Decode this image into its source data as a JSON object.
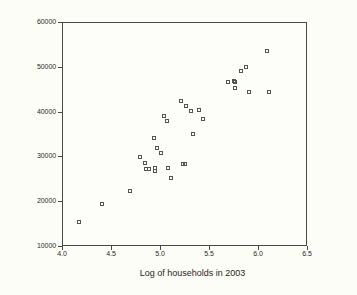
{
  "chart_data": {
    "type": "scatter",
    "title": "",
    "xlabel": "Log of households in 2003",
    "ylabel": "editorial content in sq inches",
    "xlim": [
      4.0,
      6.5
    ],
    "ylim": [
      10000,
      60000
    ],
    "xticks": [
      "4.0",
      "4.5",
      "5.0",
      "5.5",
      "6.0",
      "6.5"
    ],
    "xtick_values": [
      4.0,
      4.5,
      5.0,
      5.5,
      6.0,
      6.5
    ],
    "yticks": [
      "10000",
      "20000",
      "30000",
      "40000",
      "50000",
      "60000"
    ],
    "ytick_values": [
      10000,
      20000,
      30000,
      40000,
      50000,
      60000
    ],
    "grid": false,
    "legend": null,
    "marker": "open-square",
    "marker_color": "#55554e",
    "points": [
      {
        "x": 4.16,
        "y": 15600
      },
      {
        "x": 4.4,
        "y": 19700
      },
      {
        "x": 4.68,
        "y": 22500
      },
      {
        "x": 4.79,
        "y": 30000
      },
      {
        "x": 4.84,
        "y": 28800
      },
      {
        "x": 4.85,
        "y": 27500
      },
      {
        "x": 4.88,
        "y": 27400
      },
      {
        "x": 4.93,
        "y": 34400
      },
      {
        "x": 4.94,
        "y": 27700
      },
      {
        "x": 4.94,
        "y": 26900
      },
      {
        "x": 4.96,
        "y": 32100
      },
      {
        "x": 5.0,
        "y": 30900
      },
      {
        "x": 5.03,
        "y": 39300
      },
      {
        "x": 5.06,
        "y": 38200
      },
      {
        "x": 5.07,
        "y": 27600
      },
      {
        "x": 5.1,
        "y": 25500
      },
      {
        "x": 5.2,
        "y": 42500
      },
      {
        "x": 5.22,
        "y": 28600
      },
      {
        "x": 5.24,
        "y": 28500
      },
      {
        "x": 5.25,
        "y": 41400
      },
      {
        "x": 5.31,
        "y": 40300
      },
      {
        "x": 5.33,
        "y": 35200
      },
      {
        "x": 5.39,
        "y": 40500
      },
      {
        "x": 5.43,
        "y": 38600
      },
      {
        "x": 5.68,
        "y": 46900
      },
      {
        "x": 5.74,
        "y": 47000
      },
      {
        "x": 5.75,
        "y": 46900
      },
      {
        "x": 5.76,
        "y": 45600
      },
      {
        "x": 5.82,
        "y": 49200
      },
      {
        "x": 5.87,
        "y": 50200
      },
      {
        "x": 5.9,
        "y": 44500
      },
      {
        "x": 6.08,
        "y": 53700
      },
      {
        "x": 6.1,
        "y": 44500
      }
    ]
  }
}
